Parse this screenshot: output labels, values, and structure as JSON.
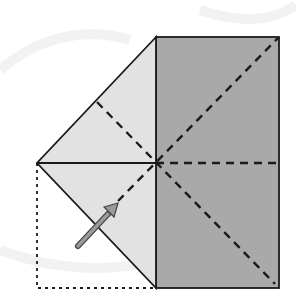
{
  "diagram": {
    "colors": {
      "background": "#ffffff",
      "dark_panel": "#a9a9a9",
      "light_flap": "#e2e2e2",
      "line": "#1a1a1a",
      "arrow_fill": "#9a9a9a",
      "arrow_stroke": "#444444"
    },
    "elements": {
      "square_panel": "Dark shaded rectangle (right half)",
      "triangle_flap": "Light folded triangle flap (left)",
      "fold_lines": "Dashed valley fold lines",
      "outline": "Dotted original position outline",
      "arrow": "Fold direction arrow"
    }
  }
}
